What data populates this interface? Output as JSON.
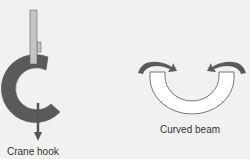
{
  "figures": [
    {
      "id": "crane-hook",
      "label": "Crane hook"
    },
    {
      "id": "curved-beam",
      "label": "Curved beam"
    }
  ],
  "colors": {
    "background": "#f1f1ef",
    "hook_fill": "#5a5a5a",
    "bar_fill": "#c4c4c4",
    "outline": "#555555",
    "beam_fill": "#ffffff"
  }
}
